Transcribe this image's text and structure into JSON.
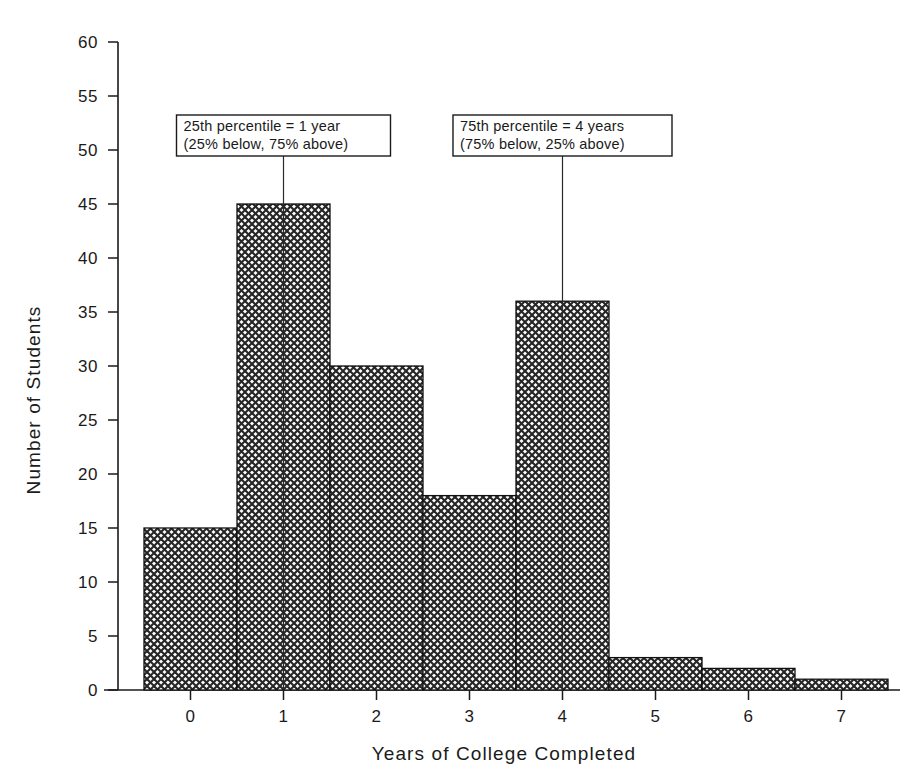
{
  "chart_data": {
    "type": "bar",
    "title": "",
    "subtitle": "",
    "xlabel": "Years of College Completed",
    "ylabel": "Number of Students",
    "categories": [
      "0",
      "1",
      "2",
      "3",
      "4",
      "5",
      "6",
      "7"
    ],
    "values": [
      15,
      45,
      30,
      18,
      36,
      3,
      2,
      1
    ],
    "xlim": [
      -0.5,
      7.5
    ],
    "ylim": [
      0,
      60
    ],
    "y_ticks": [
      0,
      5,
      10,
      15,
      20,
      25,
      30,
      35,
      40,
      45,
      50,
      55,
      60
    ],
    "y_tick_labels": [
      "0",
      "5",
      "10",
      "15",
      "20",
      "25",
      "30",
      "35",
      "40",
      "45",
      "50",
      "55",
      "60"
    ],
    "x_ticks": [
      0,
      1,
      2,
      3,
      4,
      5,
      6,
      7
    ],
    "x_tick_labels": [
      "0",
      "1",
      "2",
      "3",
      "4",
      "5",
      "6",
      "7"
    ],
    "grid": false,
    "legend": null,
    "bar_fill": "crosshatch",
    "bar_edge_color": "#111111",
    "background_color": "#ffffff",
    "annotations": [
      {
        "id": "p25",
        "line1": "25th percentile = 1 year",
        "line2": "(25% below, 75% above)",
        "x_value": 1,
        "marker_top_y_value": 49.5
      },
      {
        "id": "p75",
        "line1": "75th percentile = 4 years",
        "line2": "(75% below, 25% above)",
        "x_value": 4,
        "marker_top_y_value": 49.5
      }
    ]
  },
  "axes": {
    "y_title": "Number of Students",
    "x_title": "Years of College Completed"
  },
  "y_labels": {
    "t0": "0",
    "t5": "5",
    "t10": "10",
    "t15": "15",
    "t20": "20",
    "t25": "25",
    "t30": "30",
    "t35": "35",
    "t40": "40",
    "t45": "45",
    "t50": "50",
    "t55": "55",
    "t60": "60"
  },
  "x_labels": {
    "t0": "0",
    "t1": "1",
    "t2": "2",
    "t3": "3",
    "t4": "4",
    "t5": "5",
    "t6": "6",
    "t7": "7"
  },
  "annotation_p25": {
    "line1": "25th percentile = 1 year",
    "line2": "(25% below, 75% above)"
  },
  "annotation_p75": {
    "line1": "75th percentile = 4 years",
    "line2": "(75% below, 25% above)"
  }
}
